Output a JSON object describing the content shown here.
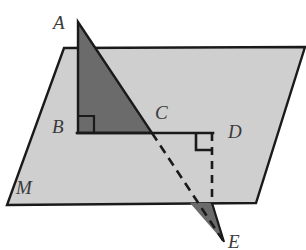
{
  "figure": {
    "kind": "geometry-diagram",
    "width": 306,
    "height": 250,
    "background_color": "#ffffff"
  },
  "colors": {
    "plane_fill": "#cfcfcf",
    "plane_stroke": "#1a1a1a",
    "triangle_fill": "#6b6b6b",
    "triangle_stroke": "#1a1a1a",
    "label_color": "#3a3a3a",
    "dashed_stroke": "#1a1a1a"
  },
  "plane": {
    "name": "M",
    "label": "M",
    "label_x": 16,
    "label_y": 178,
    "corners": [
      {
        "x": 64,
        "y": 48
      },
      {
        "x": 305,
        "y": 47
      },
      {
        "x": 256,
        "y": 203
      },
      {
        "x": 7,
        "y": 205
      }
    ]
  },
  "points": [
    {
      "name": "A",
      "label": "A",
      "x": 78,
      "y": 22,
      "label_x": 53,
      "label_y": 13
    },
    {
      "name": "B",
      "label": "B",
      "x": 78,
      "y": 133,
      "label_x": 52,
      "label_y": 117
    },
    {
      "name": "C",
      "label": "C",
      "x": 152,
      "y": 133,
      "label_x": 155,
      "label_y": 103
    },
    {
      "name": "D",
      "label": "D",
      "x": 212,
      "y": 133,
      "label_x": 228,
      "label_y": 122
    },
    {
      "name": "E",
      "label": "E",
      "x": 224,
      "y": 242,
      "label_x": 228,
      "label_y": 232
    }
  ],
  "shaded_triangle_upper": {
    "name": "triangle-ABC",
    "points": "78,22 78,133 152,133"
  },
  "shaded_triangle_lower": {
    "name": "triangle-below-plane",
    "points": "190,203 212,203 224,242"
  },
  "segments": [
    {
      "name": "segment-AB",
      "x1": 78,
      "y1": 22,
      "x2": 78,
      "y2": 133,
      "style": "solid"
    },
    {
      "name": "segment-AC",
      "x1": 78,
      "y1": 22,
      "x2": 152,
      "y2": 133,
      "style": "solid"
    },
    {
      "name": "segment-BD",
      "x1": 78,
      "y1": 133,
      "x2": 212,
      "y2": 133,
      "style": "solid"
    },
    {
      "name": "segment-CE-dashed",
      "x1": 152,
      "y1": 133,
      "x2": 224,
      "y2": 242,
      "style": "dashed"
    },
    {
      "name": "segment-DE-vertical-dashed",
      "x1": 212,
      "y1": 133,
      "x2": 212,
      "y2": 203,
      "style": "dashed"
    }
  ],
  "right_angle_marks": [
    {
      "name": "right-angle-at-B",
      "points": "78,116 94,116 94,133"
    },
    {
      "name": "right-angle-at-D",
      "points": "196,133 196,150 212,150"
    }
  ]
}
